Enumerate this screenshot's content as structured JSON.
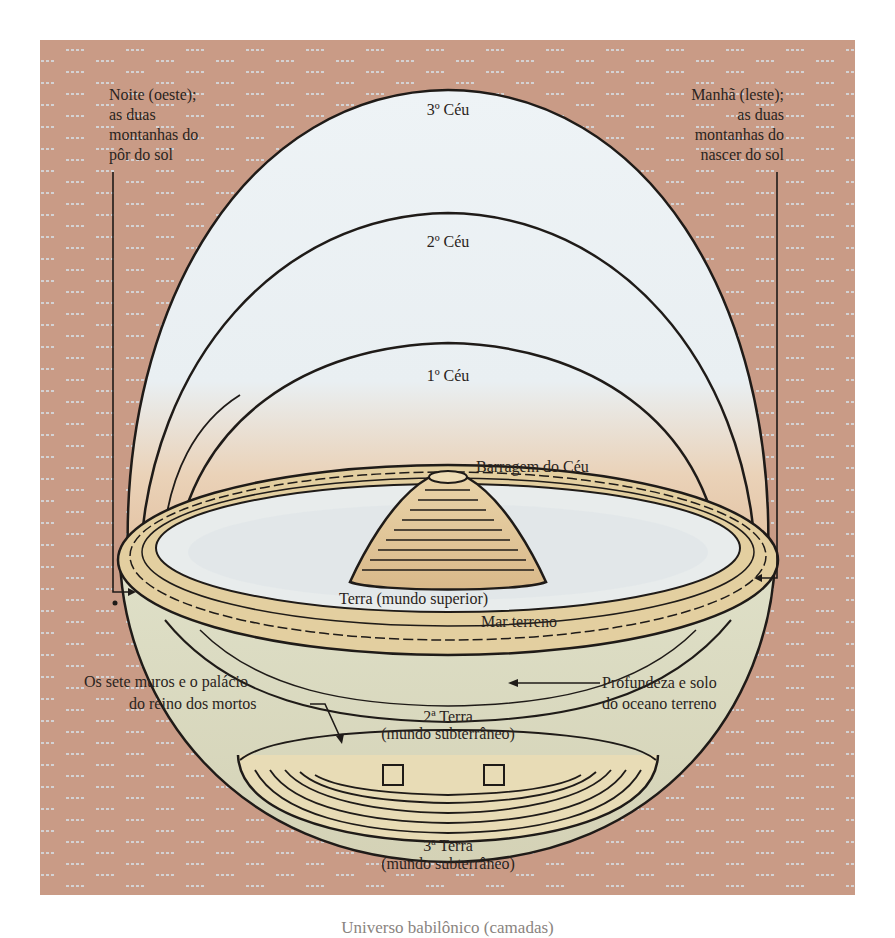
{
  "diagram": {
    "title_caption": "Universo babilônico (camadas)",
    "colors": {
      "background_brick": "#c99b86",
      "brick_dash": "#d8e4ec",
      "sky_light": "#eef3f6",
      "sky_warm": "#e6c7a8",
      "earth_band": "#e3cfa0",
      "outline": "#1f1b18",
      "text": "#2a2420"
    },
    "labels": {
      "west": [
        "Noite (oeste);",
        "as duas",
        "montanhas do",
        "pôr do sol"
      ],
      "east": [
        "Manhã (leste);",
        "as duas",
        "montanhas do",
        "nascer do sol"
      ],
      "heaven3": "3º Céu",
      "heaven2": "2º Céu",
      "heaven1": "1º Céu",
      "dam": "Barragem do Céu",
      "earth_upper": "Terra (mundo superior)",
      "sea": "Mar terreno",
      "walls": [
        "Os sete muros e o palácio",
        "do reino dos mortos"
      ],
      "depth": [
        "Profundeza e solo",
        "do oceano terreno"
      ],
      "earth2": [
        "2ª Terra",
        "(mundo subterrâneo)"
      ],
      "earth3": [
        "3ª Terra",
        "(mundo subterrâneo)"
      ]
    }
  }
}
